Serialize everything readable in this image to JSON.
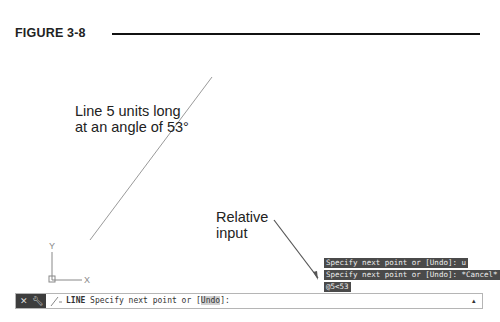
{
  "figure": {
    "label": "FIGURE 3-8"
  },
  "annotations": {
    "line_desc": "Line 5 units long at an angle of 53°",
    "relative_input": "Relative input"
  },
  "ucs": {
    "x_label": "X",
    "y_label": "Y"
  },
  "command_history": [
    "Specify next point or [Undo]: u",
    "Specify next point or [Undo]: *Cancel*",
    "@5<53"
  ],
  "command_line": {
    "close_icon": "close-icon",
    "customize_icon": "wrench-icon",
    "command_name": "LINE",
    "prompt": " Specify next point or [",
    "option": "Undo",
    "prompt_end": "]:",
    "recent_icon": "▴"
  },
  "colors": {
    "history_bg": "#4a4a4a",
    "cmd_left_bg": "#3d3d3d",
    "drawn_line": "#9a9a9a",
    "ucs": "#888888"
  }
}
